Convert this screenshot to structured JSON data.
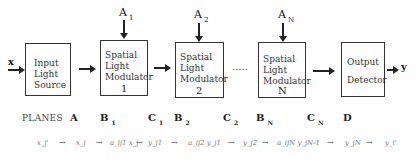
{
  "diagram": {
    "input_label": "x",
    "output_label": "y",
    "blocks": [
      {
        "id": "input-light-source",
        "lines": [
          "Input",
          "Light",
          "Source"
        ],
        "number": ""
      },
      {
        "id": "slm-1",
        "lines": [
          "Spatial",
          "Light",
          "Modulator"
        ],
        "number": "1"
      },
      {
        "id": "slm-2",
        "lines": [
          "Spatial",
          "Light",
          "Modulator"
        ],
        "number": "2"
      },
      {
        "id": "slm-n",
        "lines": [
          "Spatial",
          "Light",
          "Modulator"
        ],
        "number": "N"
      },
      {
        "id": "output-detector",
        "lines": [
          "Output",
          "Detector"
        ],
        "number": ""
      }
    ],
    "control_inputs": [
      {
        "base": "A",
        "sub": "1"
      },
      {
        "base": "A",
        "sub": "2"
      },
      {
        "base": "A",
        "sub": "N"
      }
    ],
    "ellipsis": "....."
  },
  "planes": {
    "title": "PLANES",
    "items": [
      {
        "base": "A",
        "sub": ""
      },
      {
        "base": "B",
        "sub": "1"
      },
      {
        "base": "C",
        "sub": "1"
      },
      {
        "base": "B",
        "sub": "2"
      },
      {
        "base": "C",
        "sub": "2"
      },
      {
        "base": "B",
        "sub": "N"
      },
      {
        "base": "C",
        "sub": "N"
      },
      {
        "base": "D",
        "sub": ""
      }
    ]
  },
  "equation_chain": {
    "terms": [
      "x_j'",
      "x_j",
      "a_ij1 x_j",
      "y_j1",
      "a_ij2 y_j1",
      "y_j2",
      "a_ijN y_jN-1",
      "y_jN",
      "y_i'"
    ],
    "arrow": "→"
  }
}
